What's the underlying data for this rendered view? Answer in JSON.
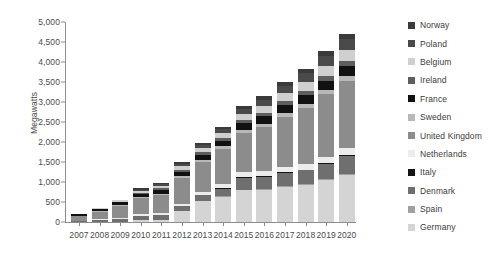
{
  "chart_data": {
    "type": "bar",
    "title": "",
    "xlabel": "",
    "ylabel": "Megawatts",
    "ylim": [
      0,
      5000
    ],
    "ytick_values": [
      0,
      500,
      1000,
      1500,
      2000,
      2500,
      3000,
      3500,
      4000,
      4500,
      5000
    ],
    "ytick_labels": [
      "0",
      "500",
      "1,000",
      "1,500",
      "2,000",
      "2,500",
      "3,000",
      "3,500",
      "4,000",
      "4,500",
      "5,000"
    ],
    "grid": false,
    "stacked": true,
    "legend_position": "right",
    "categories": [
      "2007",
      "2008",
      "2009",
      "2010",
      "2011",
      "2012",
      "2013",
      "2014",
      "2015",
      "2016",
      "2017",
      "2018",
      "2019",
      "2020"
    ],
    "series": [
      {
        "name": "Germany",
        "color": "#d4d4d4",
        "values": [
          0,
          0,
          0,
          60,
          60,
          280,
          520,
          630,
          790,
          800,
          870,
          920,
          1060,
          1180
        ]
      },
      {
        "name": "Spain",
        "color": "#a0a0a0",
        "values": [
          0,
          0,
          0,
          0,
          0,
          0,
          0,
          20,
          20,
          20,
          20,
          20,
          20,
          30
        ]
      },
      {
        "name": "Denmark",
        "color": "#6f6f6f",
        "values": [
          30,
          50,
          70,
          90,
          110,
          120,
          150,
          180,
          300,
          310,
          330,
          350,
          370,
          450
        ]
      },
      {
        "name": "Italy",
        "color": "#141414",
        "values": [
          0,
          0,
          0,
          0,
          0,
          0,
          0,
          20,
          20,
          20,
          20,
          20,
          20,
          20
        ]
      },
      {
        "name": "Netherlands",
        "color": "#ececec",
        "values": [
          0,
          20,
          30,
          40,
          50,
          60,
          70,
          90,
          110,
          120,
          130,
          150,
          160,
          170
        ]
      },
      {
        "name": "United Kingdom",
        "color": "#8c8c8c",
        "values": [
          130,
          190,
          300,
          400,
          450,
          650,
          760,
          880,
          990,
          1100,
          1250,
          1390,
          1560,
          1680
        ]
      },
      {
        "name": "Sweden",
        "color": "#b8b8b8",
        "values": [
          0,
          10,
          20,
          30,
          40,
          50,
          60,
          70,
          80,
          90,
          100,
          110,
          120,
          130
        ]
      },
      {
        "name": "France",
        "color": "#111111",
        "values": [
          30,
          60,
          70,
          80,
          90,
          100,
          120,
          140,
          160,
          180,
          200,
          210,
          220,
          230
        ]
      },
      {
        "name": "Ireland",
        "color": "#5e5e5e",
        "values": [
          0,
          0,
          20,
          30,
          40,
          50,
          60,
          70,
          80,
          90,
          100,
          110,
          120,
          130
        ]
      },
      {
        "name": "Belgium",
        "color": "#cfcfcf",
        "values": [
          0,
          20,
          30,
          50,
          60,
          80,
          100,
          120,
          140,
          170,
          200,
          230,
          260,
          290
        ]
      },
      {
        "name": "Poland",
        "color": "#4a4a4a",
        "values": [
          0,
          0,
          0,
          30,
          40,
          60,
          80,
          100,
          130,
          160,
          190,
          220,
          250,
          280
        ]
      },
      {
        "name": "Norway",
        "color": "#3a3a3a",
        "values": [
          0,
          0,
          0,
          30,
          30,
          40,
          50,
          60,
          70,
          80,
          90,
          100,
          110,
          120
        ]
      }
    ],
    "totals": [
      190,
      350,
      540,
      840,
      970,
      1490,
      1970,
      2380,
      2890,
      3140,
      3500,
      3830,
      4270,
      4710
    ]
  },
  "legend": {
    "items": [
      {
        "label": "Norway",
        "color": "#3a3a3a"
      },
      {
        "label": "Poland",
        "color": "#4a4a4a"
      },
      {
        "label": "Belgium",
        "color": "#cfcfcf"
      },
      {
        "label": "Ireland",
        "color": "#5e5e5e"
      },
      {
        "label": "France",
        "color": "#111111"
      },
      {
        "label": "Sweden",
        "color": "#b8b8b8"
      },
      {
        "label": "United Kingdom",
        "color": "#8c8c8c"
      },
      {
        "label": "Netherlands",
        "color": "#ececec"
      },
      {
        "label": "Italy",
        "color": "#141414"
      },
      {
        "label": "Denmark",
        "color": "#6f6f6f"
      },
      {
        "label": "Spain",
        "color": "#a0a0a0"
      },
      {
        "label": "Germany",
        "color": "#d4d4d4"
      }
    ]
  }
}
